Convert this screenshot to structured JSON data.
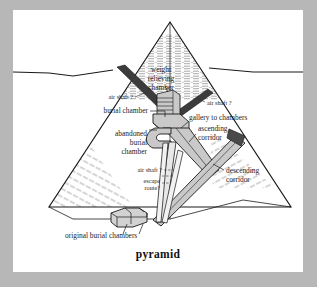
{
  "figure": {
    "caption": "pyramid",
    "colors": {
      "mat": "#b7b7b7",
      "panel": "#ffffff",
      "ink": "#1a1a1a",
      "stone_fill": "#c9c9c9",
      "shaft_dark": "#3a3a3a",
      "entrance_dark": "#4a4a4a"
    }
  },
  "labels": [
    {
      "id": "weight-relieving-chamber",
      "lines": [
        "weight",
        "relieving",
        "chamber"
      ],
      "anchor": "middle",
      "x": 148,
      "y": 62
    },
    {
      "id": "air-shaft-upper",
      "lines": [
        "air shaft ?"
      ],
      "anchor": "end",
      "x": 120,
      "y": 89
    },
    {
      "id": "burial-chamber",
      "lines": [
        "burial chamber"
      ],
      "anchor": "end",
      "x": 135,
      "y": 103
    },
    {
      "id": "abandoned-burial-chamber",
      "lines": [
        "abandoned",
        "burial",
        "chamber"
      ],
      "anchor": "end",
      "x": 134,
      "y": 126
    },
    {
      "id": "air-shaft-right",
      "lines": [
        "air shaft ?"
      ],
      "anchor": "start",
      "x": 194,
      "y": 95
    },
    {
      "id": "gallery-to-chambers",
      "lines": [
        "gallery to chambers"
      ],
      "anchor": "start",
      "x": 176,
      "y": 110
    },
    {
      "id": "ascending-corridor",
      "lines": [
        "ascending",
        "corridor"
      ],
      "anchor": "start",
      "x": 185,
      "y": 121
    },
    {
      "id": "air-shaft-lower",
      "lines": [
        "air shaft ?"
      ],
      "anchor": "end",
      "x": 149,
      "y": 162
    },
    {
      "id": "escape-route",
      "lines": [
        "escape",
        "route?"
      ],
      "anchor": "end",
      "x": 147,
      "y": 173
    },
    {
      "id": "descending-corridor",
      "lines": [
        "descending",
        "corridor"
      ],
      "anchor": "start",
      "x": 213,
      "y": 163
    },
    {
      "id": "original-burial-chambers",
      "lines": [
        "original burial chambers"
      ],
      "anchor": "start",
      "x": 52,
      "y": 228
    }
  ]
}
